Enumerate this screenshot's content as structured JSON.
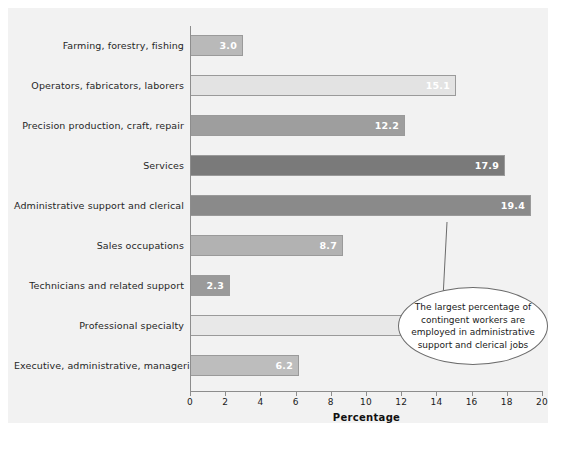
{
  "chart_data": {
    "type": "bar",
    "orientation": "horizontal",
    "title": "",
    "xlabel": "Percentage",
    "ylabel": "",
    "xlim": [
      0,
      20
    ],
    "xticks": [
      0,
      2,
      4,
      6,
      8,
      10,
      12,
      14,
      16,
      18,
      20
    ],
    "grid": false,
    "legend": null,
    "categories": [
      "Farming, forestry, fishing",
      "Operators, fabricators, laborers",
      "Precision production, craft, repair",
      "Services",
      "Administrative support and clerical",
      "Sales occupations",
      "Technicians and related support",
      "Professional specialty",
      "Executive, administrative, managerial"
    ],
    "values": [
      3.0,
      15.1,
      12.2,
      17.9,
      19.4,
      8.7,
      2.3,
      15.2,
      6.2
    ],
    "value_labels": [
      "3.0",
      "15.1",
      "12.2",
      "17.9",
      "19.4",
      "8.7",
      "2.3",
      "15.2",
      "6.2"
    ],
    "bar_colors": [
      "#b9b9b9",
      "#e3e3e3",
      "#9e9e9e",
      "#7a7a7a",
      "#8a8a8a",
      "#b2b2b2",
      "#9a9a9a",
      "#e8e8e8",
      "#bdbdbd"
    ],
    "annotations": [
      {
        "name": "callout",
        "target_category": "Administrative support and clerical",
        "lines": [
          "The largest percentage of",
          "contingent workers are",
          "employed in administrative",
          "support and clerical jobs"
        ]
      }
    ],
    "colors": {
      "background": "#ffffff",
      "plot_background": "#f2f2f2",
      "axis": "#8d8d8d",
      "text": "#1a1a1a",
      "value_label": "#ffffff",
      "callout_border": "#6b6b6b"
    }
  }
}
